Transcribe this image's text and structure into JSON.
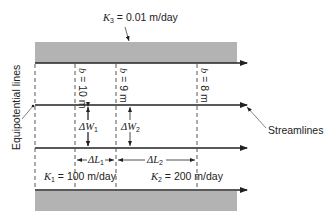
{
  "diagram": {
    "title_k3": {
      "symbol": "K",
      "subscript": "3",
      "rest": " = 0.01 m/day"
    },
    "k1": {
      "symbol": "K",
      "subscript": "1",
      "rest": " = 100 m/day"
    },
    "k2": {
      "symbol": "K",
      "subscript": "2",
      "rest": " = 200 m/day"
    },
    "b_labels": [
      {
        "symbol": "b",
        "rest": " = 10 m"
      },
      {
        "symbol": "b",
        "rest": " = 9 m"
      },
      {
        "symbol": "b",
        "rest": " = 8 m"
      }
    ],
    "delta_w": [
      {
        "prefix": "Δ",
        "symbol": "W",
        "subscript": "1"
      },
      {
        "prefix": "Δ",
        "symbol": "W",
        "subscript": "2"
      }
    ],
    "delta_l": [
      {
        "prefix": "Δ",
        "symbol": "L",
        "subscript": "1"
      },
      {
        "prefix": "Δ",
        "symbol": "L",
        "subscript": "2"
      }
    ],
    "callouts": {
      "equipotential": "Equipotential lines",
      "streamlines": "Streamlines"
    },
    "colors": {
      "confining_layer": "#b3b3b3",
      "line": "#222222"
    }
  }
}
